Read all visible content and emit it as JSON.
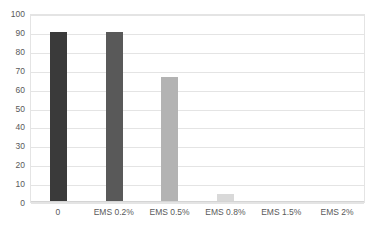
{
  "chart_data": {
    "type": "bar",
    "title": "",
    "subtitle": "",
    "xlabel": "",
    "ylabel": "",
    "categories": [
      "0",
      "EMS 0.2%",
      "EMS 0.5%",
      "EMS 0.8%",
      "EMS 1.5%",
      "EMS 2%"
    ],
    "values": [
      90,
      90,
      66,
      4,
      0,
      0
    ],
    "bar_colors": [
      "#3a3a3a",
      "#595959",
      "#b3b3b3",
      "#d9d9d9",
      "#d9d9d9",
      "#d9d9d9"
    ],
    "ylim": [
      0,
      100
    ],
    "ytick_labels": [
      "100",
      "90",
      "80",
      "70",
      "60",
      "50",
      "40",
      "30",
      "20",
      "10",
      "0"
    ],
    "ytick_values": [
      100,
      90,
      80,
      70,
      60,
      50,
      40,
      30,
      20,
      10,
      0
    ],
    "grid": true,
    "grid_color": "#e4e4e4",
    "legend": false,
    "legend_position": "none",
    "plot_background": "#ffffff",
    "axis_text_color": "#595959"
  }
}
